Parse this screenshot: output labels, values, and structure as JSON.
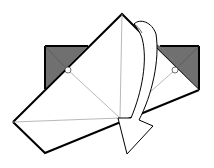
{
  "diagram": {
    "colors": {
      "background": "#ffffff",
      "paper_front": "#ffffff",
      "paper_back": "#707070",
      "outline": "#000000",
      "crease": "#9a9a9a",
      "arrow_fill": "#ffffff",
      "arrow_stroke": "#000000"
    },
    "elements": [
      {
        "name": "left-colored-flap",
        "description": "gray square corner visible at upper left"
      },
      {
        "name": "right-colored-flap",
        "description": "gray square corner visible at upper right"
      },
      {
        "name": "folded-white-flap",
        "description": "large white flap rotated diagonally"
      },
      {
        "name": "crease-lines",
        "description": "thin valley/mountain crease lines"
      },
      {
        "name": "pivot-circles",
        "description": "small circles marking pivot points"
      },
      {
        "name": "fold-arrow",
        "description": "curved hollow arrow indicating flap swings down and right"
      }
    ]
  }
}
